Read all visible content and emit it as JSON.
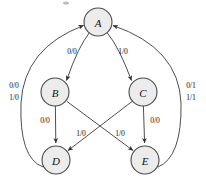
{
  "diagram": {
    "type": "state-transition-diagram",
    "title": "",
    "colors": {
      "node_fill": "#ececec",
      "node_stroke": "#4a4a4a",
      "edge_stroke": "#3a3a3a",
      "text": "#111111",
      "background": "#ffffff"
    },
    "nodes": [
      {
        "id": "A",
        "label": "A",
        "cx": 98,
        "cy": 22,
        "r": 14
      },
      {
        "id": "B",
        "label": "B",
        "cx": 55,
        "cy": 92,
        "r": 14
      },
      {
        "id": "C",
        "label": "C",
        "cx": 143,
        "cy": 92,
        "r": 14
      },
      {
        "id": "D",
        "label": "D",
        "cx": 56,
        "cy": 160,
        "r": 14
      },
      {
        "id": "E",
        "label": "E",
        "cx": 145,
        "cy": 160,
        "r": 14
      }
    ],
    "edges": [
      {
        "id": "a-to-b",
        "from": "A",
        "to": "B",
        "label": "0/0",
        "lx": 72,
        "ly": 51
      },
      {
        "id": "a-to-c",
        "from": "A",
        "to": "C",
        "label": "1/0",
        "lx": 123,
        "ly": 51
      },
      {
        "id": "b-to-d",
        "from": "B",
        "to": "D",
        "label": "0/0",
        "lx": 45,
        "ly": 120
      },
      {
        "id": "c-to-e",
        "from": "C",
        "to": "E",
        "label": "0/0",
        "lx": 155,
        "ly": 120
      },
      {
        "id": "b-to-e",
        "from": "B",
        "to": "E",
        "label": "1/0",
        "lx": 120,
        "ly": 133
      },
      {
        "id": "c-to-d",
        "from": "C",
        "to": "D",
        "label": "1/0",
        "lx": 81,
        "ly": 133
      },
      {
        "id": "d-to-a",
        "from": "D",
        "to": "A",
        "label_line1": "0/0",
        "label_line2": "1/0",
        "lx": 14,
        "ly": 92
      },
      {
        "id": "e-to-a",
        "from": "E",
        "to": "A",
        "label_line1": "0/1",
        "label_line2": "1/1",
        "lx": 190,
        "ly": 92
      }
    ]
  }
}
